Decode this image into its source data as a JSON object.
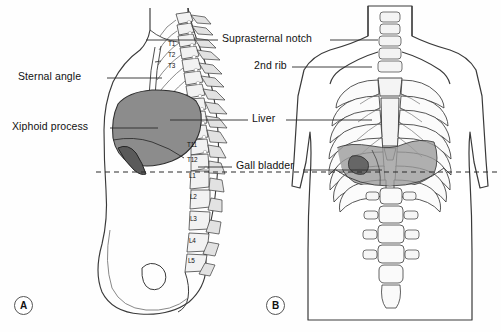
{
  "figure": {
    "panels": [
      {
        "id": "A",
        "view": "lateral-sagittal-section"
      },
      {
        "id": "B",
        "view": "anterior-thorax"
      }
    ],
    "transpyloric_plane": "dashed-horizontal-reference-line"
  },
  "labels": {
    "left": [
      {
        "key": "sternal-angle",
        "text": "Sternal angle",
        "x": 18,
        "y": 72,
        "leader_x1": 107,
        "leader_x2": 162,
        "leader_y": 78
      },
      {
        "key": "xiphoid-process",
        "text": "Xiphoid process",
        "x": 12,
        "y": 122,
        "leader_x1": 110,
        "leader_x2": 155,
        "leader_y": 128
      }
    ],
    "center": [
      {
        "key": "suprasternal-notch",
        "text": "Suprasternal notch",
        "x": 222,
        "y": 34,
        "leader_x1": 330,
        "leader_x2": 378,
        "leader_y": 40
      },
      {
        "key": "second-rib",
        "text": "2nd rib",
        "x": 254,
        "y": 61,
        "leader_x1": 294,
        "leader_x2": 372,
        "leader_y": 67
      },
      {
        "key": "liver",
        "text": "Liver",
        "x": 252,
        "y": 114,
        "leader_x1": 286,
        "leader_x2": 362,
        "leader_y": 120
      },
      {
        "key": "gall-bladder",
        "text": "Gall bladder",
        "x": 236,
        "y": 161,
        "leader_x1": 305,
        "leader_x2": 380,
        "leader_y": 167
      }
    ]
  },
  "vertebrae": {
    "thoracic_upper": [
      "T1",
      "T2",
      "T3"
    ],
    "thoracolumbar": [
      "T11",
      "T12",
      "L1",
      "L2",
      "L3",
      "L4",
      "L5"
    ],
    "positions": [
      {
        "label": "T1",
        "x": 168,
        "y": 44
      },
      {
        "label": "T2",
        "x": 168,
        "y": 55
      },
      {
        "label": "T3",
        "x": 168,
        "y": 66
      },
      {
        "label": "T11",
        "x": 189,
        "y": 145
      },
      {
        "label": "T12",
        "x": 189,
        "y": 160
      },
      {
        "label": "L1",
        "x": 190,
        "y": 176
      },
      {
        "label": "L2",
        "x": 190,
        "y": 196
      },
      {
        "label": "L3",
        "x": 190,
        "y": 218
      },
      {
        "label": "L4",
        "x": 189,
        "y": 240
      },
      {
        "label": "L5",
        "x": 188,
        "y": 260
      }
    ]
  },
  "colors": {
    "outline": "#3a3a3a",
    "bone_fill": "#f2f2f2",
    "bone_shade": "#d8d8d8",
    "liver_fill": "#8c8c8c",
    "gallbladder_fill": "#5f5f5f",
    "organ_overlay": "#9a9a9a",
    "dashed_line": "#2b2b2b",
    "background": "#fefefe",
    "text": "#111111"
  },
  "panel_ids": [
    {
      "letter": "A",
      "x": 14,
      "y": 296
    },
    {
      "letter": "B",
      "x": 266,
      "y": 296
    }
  ]
}
